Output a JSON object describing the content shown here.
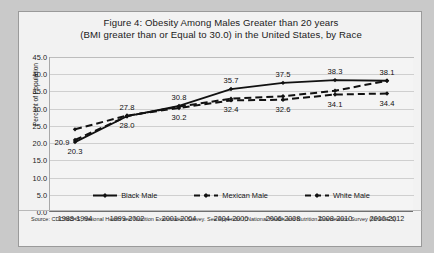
{
  "figure": {
    "title_line1": "Figure 4: Obesity Among Males Greater than 20 years",
    "title_line2": "(BMI greater than or Equal to 30.0) in the United States, by Race",
    "source_note": "Source: CDC/NCHS, National Health and Nutrition Examination Survey. See Appendix I, National Health and Nutrition Examination Survey (NHANES)."
  },
  "legend": {
    "items": [
      {
        "label": "Black Male",
        "style": "solid",
        "color": "#111111"
      },
      {
        "label": "Mexican Male",
        "style": "dashed",
        "color": "#111111"
      },
      {
        "label": "White Male",
        "style": "dashed",
        "color": "#111111"
      }
    ]
  },
  "axes": {
    "y_label": "Percent of Population",
    "y_ticks": [
      "0.0",
      "5.0",
      "10.0",
      "15.0",
      "20.0",
      "25.0",
      "30.0",
      "35.0",
      "40.0",
      "45.0"
    ],
    "x_ticks": [
      "1988-1994",
      "1999-2002",
      "2001-2004",
      "2004-2006",
      "2006-2008",
      "2008-2010",
      "2010-2012"
    ]
  },
  "chart_data": {
    "type": "line",
    "title": "Figure 4: Obesity Among Males Greater than 20 years (BMI greater than or Equal to 30.0) in the United States, by Race",
    "xlabel": "",
    "ylabel": "Percent of Population",
    "ylim": [
      0.0,
      45.0
    ],
    "ytick_step": 5.0,
    "grid": true,
    "legend_position": "bottom-center",
    "categories": [
      "1988-1994",
      "1999-2002",
      "2001-2004",
      "2004-2006",
      "2006-2008",
      "2008-2010",
      "2010-2012"
    ],
    "series": [
      {
        "name": "Black Male",
        "style": "solid",
        "marker": "diamond",
        "values": [
          20.3,
          27.8,
          30.8,
          35.7,
          37.5,
          38.3,
          38.1
        ],
        "labels": [
          "20.3",
          "27.8",
          "30.8",
          "35.7",
          "37.5",
          "38.3",
          "38.1"
        ],
        "label_pos": [
          "below",
          "above",
          "above",
          "above",
          "above",
          "above",
          "above"
        ]
      },
      {
        "name": "Mexican Male",
        "style": "dashed",
        "marker": "diamond",
        "values": [
          24.0,
          28.0,
          30.2,
          32.4,
          32.6,
          34.1,
          34.4
        ],
        "labels": [
          "",
          "28.0",
          "30.2",
          "32.4",
          "32.6",
          "34.1",
          "34.4"
        ],
        "label_pos": [
          "none",
          "below",
          "below",
          "below",
          "below",
          "below",
          "below"
        ]
      },
      {
        "name": "White Male",
        "style": "dashed",
        "marker": "diamond",
        "values": [
          20.9,
          27.8,
          30.6,
          32.9,
          33.6,
          35.2,
          38.1
        ],
        "labels": [
          "20.9",
          "",
          "",
          "",
          "",
          "",
          ""
        ],
        "label_pos": [
          "left",
          "none",
          "none",
          "none",
          "none",
          "none",
          "none"
        ]
      }
    ]
  }
}
